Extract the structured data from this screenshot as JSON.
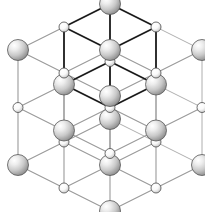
{
  "figure": {
    "background": "#ffffff",
    "width": 205,
    "height": 212
  },
  "projection": {
    "origin": [
      18,
      50
    ],
    "axis_x": [
      46,
      23
    ],
    "axis_y": [
      46,
      -23
    ],
    "axis_z": [
      0,
      57.5
    ],
    "note": "lattice point P(i,j,k) = origin + i*axis_x + j*axis_y + k*axis_z, i,j,k in 0..2"
  },
  "atoms": {
    "large": {
      "label": "large-sphere",
      "radius": 10.5,
      "fill_light": "#ffffff",
      "fill_mid": "#d8d8d8",
      "fill_dark": "#8a8a8a",
      "stroke": "#555555",
      "parity": "even",
      "count": 14
    },
    "small": {
      "label": "small-sphere",
      "radius": 5.0,
      "fill_light": "#ffffff",
      "fill_mid": "#f2f2f2",
      "fill_dark": "#bbbbbb",
      "stroke": "#4a4a4a",
      "parity": "odd",
      "count": 13
    },
    "rule": "sphere is large when (i+j+k) is even, small when odd"
  },
  "bonds": {
    "outer": {
      "label": "outer-lattice-bond",
      "color": "#9a9a9a",
      "width": 1.1
    },
    "inner": {
      "label": "inner-unit-cell-bond",
      "color": "#1a1a1a",
      "width": 1.8,
      "note": "edges of the highlighted central unit cell drawn in black"
    }
  },
  "chart_data": {
    "type": "scatter",
    "xlabel": "",
    "ylabel": "",
    "grid": true,
    "legend": null,
    "series": [
      {
        "name": "large-sphere",
        "marker": "large-gray-sphere",
        "values": [
          [
            0,
            0,
            0
          ],
          [
            2,
            0,
            0
          ],
          [
            1,
            1,
            0
          ],
          [
            0,
            2,
            0
          ],
          [
            2,
            2,
            0
          ],
          [
            1,
            0,
            1
          ],
          [
            0,
            1,
            1
          ],
          [
            2,
            1,
            1
          ],
          [
            1,
            2,
            1
          ],
          [
            0,
            0,
            2
          ],
          [
            2,
            0,
            2
          ],
          [
            1,
            1,
            2
          ],
          [
            0,
            2,
            2
          ],
          [
            2,
            2,
            2
          ]
        ]
      },
      {
        "name": "small-sphere",
        "marker": "small-white-sphere",
        "values": [
          [
            1,
            0,
            0
          ],
          [
            0,
            1,
            0
          ],
          [
            2,
            1,
            0
          ],
          [
            1,
            2,
            0
          ],
          [
            0,
            0,
            1
          ],
          [
            2,
            0,
            1
          ],
          [
            1,
            1,
            1
          ],
          [
            0,
            2,
            1
          ],
          [
            2,
            2,
            1
          ],
          [
            1,
            0,
            2
          ],
          [
            0,
            1,
            2
          ],
          [
            2,
            1,
            2
          ],
          [
            1,
            2,
            2
          ]
        ]
      }
    ],
    "inner_cell": {
      "i_range": [
        0,
        1
      ],
      "j_range": [
        1,
        2
      ],
      "k_range": [
        0,
        1
      ],
      "note": "highlighted cube drawn with black edges"
    }
  }
}
